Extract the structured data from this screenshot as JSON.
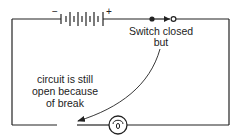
{
  "diagram": {
    "colors": {
      "line": "#222222",
      "background": "#ffffff"
    },
    "battery": {
      "negative_label": "−",
      "positive_label": "+",
      "cell_count": 6
    },
    "switch": {
      "state": "closed"
    },
    "bulb": {
      "symbol": "lamp"
    },
    "break": {
      "present": true
    },
    "labels": {
      "switch_line1": "Switch closed",
      "switch_line2": "but",
      "break_line1": "circuit is still",
      "break_line2": "open because",
      "break_line3": "of break"
    }
  }
}
